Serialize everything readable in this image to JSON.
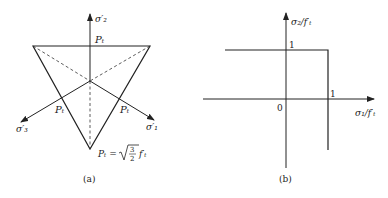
{
  "panel_a": {
    "caption": "(a)",
    "axes": {
      "sigma2": "σ′₂",
      "sigma1": "σ′₁",
      "sigma3": "σ′₃"
    },
    "edge_labels": {
      "top": "Pₜ",
      "left": "Pₜ",
      "right": "Pₜ"
    },
    "formula": {
      "lhs": "Pₜ =",
      "sqrt_num": "3",
      "sqrt_den": "2",
      "rhs": "f′ₜ"
    }
  },
  "panel_b": {
    "caption": "(b)",
    "y_axis_label": "σ₂/f′ₜ",
    "x_axis_label": "σ₁/f′ₜ",
    "origin_label": "0",
    "y_tick": "1",
    "x_tick": "1"
  }
}
